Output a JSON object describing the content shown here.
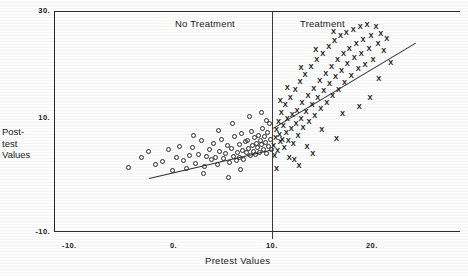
{
  "figure": {
    "ylabel_lines": [
      "Post-",
      "test",
      "Values"
    ],
    "xlabel": "Pretest Values",
    "panels": {
      "left": "No Treatment",
      "right": "Treatment"
    },
    "axis": {
      "x_ticks": [
        "-10.",
        "0.",
        "10.",
        "20."
      ],
      "y_ticks": [
        "30.",
        "10.",
        "-10."
      ]
    }
  },
  "chart_data": {
    "type": "scatter",
    "title": "",
    "xlabel": "Pretest Values",
    "ylabel": "Post-test Values",
    "xlim": [
      -10,
      21
    ],
    "ylim": [
      -10,
      30
    ],
    "x_ticks": [
      -10,
      0,
      10,
      20
    ],
    "y_ticks": [
      -10,
      10,
      30
    ],
    "grid": false,
    "legend": "none",
    "panel_divider_x": 10,
    "annotations": [
      {
        "text": "No Treatment",
        "x": 2.5,
        "y": 28.5
      },
      {
        "text": "Treatment",
        "x": 13.5,
        "y": 28.5
      }
    ],
    "series": [
      {
        "name": "No Treatment",
        "marker": "open-circle",
        "region": "x < 10",
        "points": [
          [
            -4.6,
            1.3
          ],
          [
            -3.3,
            3.0
          ],
          [
            -2.6,
            4.2
          ],
          [
            -1.9,
            1.9
          ],
          [
            -1.2,
            2.3
          ],
          [
            -0.6,
            4.5
          ],
          [
            -0.2,
            0.8
          ],
          [
            0.3,
            3.1
          ],
          [
            0.6,
            5.0
          ],
          [
            1.0,
            2.6
          ],
          [
            1.3,
            1.2
          ],
          [
            1.6,
            3.4
          ],
          [
            1.9,
            4.9
          ],
          [
            2.2,
            2.0
          ],
          [
            2.5,
            3.6
          ],
          [
            2.8,
            6.0
          ],
          [
            3.1,
            1.5
          ],
          [
            3.3,
            3.2
          ],
          [
            3.6,
            4.4
          ],
          [
            3.8,
            2.7
          ],
          [
            4.0,
            5.5
          ],
          [
            4.2,
            3.0
          ],
          [
            4.4,
            1.8
          ],
          [
            4.6,
            4.1
          ],
          [
            4.8,
            6.3
          ],
          [
            5.0,
            2.9
          ],
          [
            5.2,
            3.8
          ],
          [
            5.4,
            5.2
          ],
          [
            5.6,
            2.2
          ],
          [
            5.8,
            4.6
          ],
          [
            6.0,
            3.3
          ],
          [
            6.1,
            6.8
          ],
          [
            6.3,
            2.6
          ],
          [
            6.4,
            4.0
          ],
          [
            6.6,
            5.4
          ],
          [
            6.7,
            3.1
          ],
          [
            6.9,
            7.2
          ],
          [
            7.0,
            4.3
          ],
          [
            7.1,
            2.8
          ],
          [
            7.3,
            5.8
          ],
          [
            7.4,
            3.9
          ],
          [
            7.5,
            6.1
          ],
          [
            7.6,
            4.7
          ],
          [
            7.8,
            3.4
          ],
          [
            7.9,
            7.6
          ],
          [
            8.0,
            5.1
          ],
          [
            8.1,
            4.2
          ],
          [
            8.2,
            6.5
          ],
          [
            8.3,
            3.6
          ],
          [
            8.4,
            5.6
          ],
          [
            8.5,
            4.8
          ],
          [
            8.6,
            7.0
          ],
          [
            8.7,
            4.0
          ],
          [
            8.8,
            6.0
          ],
          [
            8.9,
            5.3
          ],
          [
            9.0,
            8.2
          ],
          [
            9.1,
            4.5
          ],
          [
            9.2,
            6.7
          ],
          [
            9.3,
            5.7
          ],
          [
            9.4,
            3.8
          ],
          [
            9.5,
            7.4
          ],
          [
            9.6,
            5.0
          ],
          [
            9.7,
            9.0
          ],
          [
            9.8,
            6.2
          ],
          [
            9.9,
            4.4
          ],
          [
            5.9,
            9.1
          ],
          [
            7.7,
            10.2
          ],
          [
            8.9,
            11.0
          ],
          [
            9.4,
            9.6
          ],
          [
            3.0,
            0.2
          ],
          [
            5.5,
            -0.4
          ],
          [
            6.8,
            0.9
          ],
          [
            2.0,
            6.9
          ],
          [
            4.5,
            7.8
          ]
        ],
        "fit_line": {
          "x0": -2.5,
          "y0": -0.6,
          "x1": 10.0,
          "y1": 4.4
        }
      },
      {
        "name": "Treatment",
        "marker": "x-cross",
        "region": "x >= 10",
        "points": [
          [
            10.1,
            5.2
          ],
          [
            10.2,
            3.4
          ],
          [
            10.3,
            6.6
          ],
          [
            10.4,
            8.0
          ],
          [
            10.5,
            4.3
          ],
          [
            10.6,
            9.4
          ],
          [
            10.7,
            7.1
          ],
          [
            10.8,
            5.8
          ],
          [
            10.9,
            11.0
          ],
          [
            11.0,
            6.2
          ],
          [
            11.1,
            8.6
          ],
          [
            11.2,
            4.8
          ],
          [
            11.3,
            12.3
          ],
          [
            11.4,
            7.5
          ],
          [
            11.5,
            9.9
          ],
          [
            11.6,
            6.0
          ],
          [
            11.8,
            13.6
          ],
          [
            11.9,
            8.2
          ],
          [
            12.0,
            10.6
          ],
          [
            12.1,
            5.5
          ],
          [
            12.3,
            15.0
          ],
          [
            12.4,
            9.1
          ],
          [
            12.5,
            11.4
          ],
          [
            12.6,
            7.0
          ],
          [
            12.8,
            16.4
          ],
          [
            12.9,
            10.0
          ],
          [
            13.0,
            12.8
          ],
          [
            13.1,
            8.4
          ],
          [
            13.3,
            17.6
          ],
          [
            13.4,
            11.2
          ],
          [
            13.6,
            14.0
          ],
          [
            13.7,
            9.3
          ],
          [
            13.9,
            19.0
          ],
          [
            14.0,
            12.4
          ],
          [
            14.2,
            15.2
          ],
          [
            14.3,
            10.4
          ],
          [
            14.5,
            20.2
          ],
          [
            14.6,
            13.6
          ],
          [
            14.8,
            16.6
          ],
          [
            14.9,
            11.6
          ],
          [
            15.1,
            21.4
          ],
          [
            15.2,
            14.8
          ],
          [
            15.4,
            17.8
          ],
          [
            15.5,
            12.8
          ],
          [
            15.7,
            22.6
          ],
          [
            15.8,
            16.0
          ],
          [
            16.0,
            19.0
          ],
          [
            16.1,
            13.9
          ],
          [
            16.3,
            23.6
          ],
          [
            16.4,
            17.2
          ],
          [
            16.6,
            20.2
          ],
          [
            16.7,
            15.0
          ],
          [
            16.9,
            24.4
          ],
          [
            17.0,
            18.4
          ],
          [
            17.2,
            21.4
          ],
          [
            17.3,
            16.2
          ],
          [
            17.5,
            25.0
          ],
          [
            17.6,
            19.6
          ],
          [
            17.8,
            22.2
          ],
          [
            18.0,
            17.4
          ],
          [
            18.2,
            25.6
          ],
          [
            18.3,
            20.6
          ],
          [
            18.5,
            23.0
          ],
          [
            18.7,
            18.6
          ],
          [
            18.9,
            26.0
          ],
          [
            19.0,
            21.4
          ],
          [
            19.2,
            23.8
          ],
          [
            19.4,
            19.4
          ],
          [
            19.6,
            26.4
          ],
          [
            19.8,
            22.2
          ],
          [
            20.0,
            24.4
          ],
          [
            20.2,
            20.2
          ],
          [
            20.5,
            26.0
          ],
          [
            20.7,
            23.0
          ],
          [
            21.0,
            24.8
          ],
          [
            12.2,
            2.8
          ],
          [
            11.7,
            3.0
          ],
          [
            10.4,
            1.2
          ],
          [
            12.7,
            1.6
          ],
          [
            15.0,
            8.0
          ],
          [
            17.1,
            10.8
          ],
          [
            19.9,
            13.6
          ],
          [
            20.8,
            17.0
          ],
          [
            22.0,
            19.8
          ],
          [
            13.5,
            5.0
          ],
          [
            16.5,
            6.4
          ],
          [
            14.1,
            3.8
          ],
          [
            18.8,
            12.0
          ],
          [
            21.3,
            21.8
          ],
          [
            21.6,
            24.0
          ],
          [
            11.5,
            15.4
          ],
          [
            12.9,
            18.8
          ],
          [
            14.4,
            22.0
          ],
          [
            16.2,
            25.2
          ],
          [
            10.8,
            13.0
          ]
        ],
        "fit_line": {
          "x0": 10.0,
          "y0": 8.2,
          "x1": 24.5,
          "y1": 23.2
        }
      }
    ]
  }
}
